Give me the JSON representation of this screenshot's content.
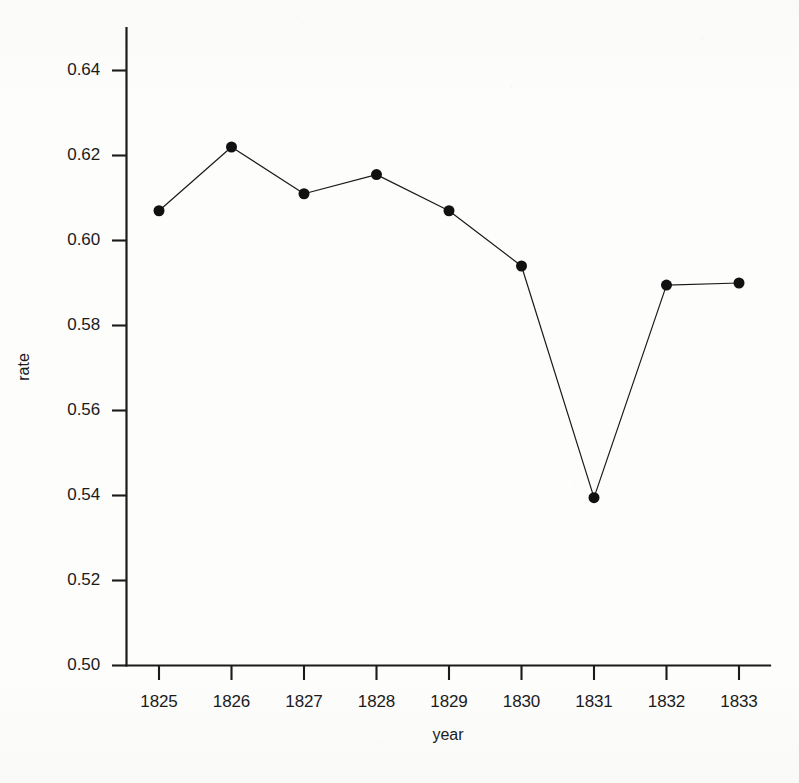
{
  "chart_data": {
    "type": "line",
    "title": "",
    "subtitle": "",
    "xlabel": "year",
    "ylabel": "rate",
    "x": [
      1825,
      1826,
      1827,
      1828,
      1829,
      1830,
      1831,
      1832,
      1833
    ],
    "categories": [
      "1825",
      "1826",
      "1827",
      "1828",
      "1829",
      "1830",
      "1831",
      "1832",
      "1833"
    ],
    "values": [
      0.607,
      0.622,
      0.611,
      0.6155,
      0.607,
      0.594,
      0.5395,
      0.5895,
      0.59
    ],
    "series": [
      {
        "name": "rate",
        "values": [
          0.607,
          0.622,
          0.611,
          0.6155,
          0.607,
          0.594,
          0.5395,
          0.5895,
          0.59
        ]
      }
    ],
    "xlim": [
      1824.6,
      1833.4
    ],
    "ylim": [
      0.5,
      0.6495
    ],
    "xticks": [
      1825,
      1826,
      1827,
      1828,
      1829,
      1830,
      1831,
      1832,
      1833
    ],
    "yticks": [
      0.5,
      0.52,
      0.54,
      0.56,
      0.58,
      0.6,
      0.62,
      0.64
    ],
    "ytick_labels": [
      "0.50",
      "0.52",
      "0.54",
      "0.56",
      "0.58",
      "0.60",
      "0.62",
      "0.64"
    ],
    "xtick_labels": [
      "1825",
      "1826",
      "1827",
      "1828",
      "1829",
      "1830",
      "1831",
      "1832",
      "1833"
    ],
    "grid": false,
    "legend": null,
    "marker": "filled-circle",
    "marker_size": 11,
    "line_width": 1.1,
    "line_color": "#1a1a1a",
    "marker_color": "#111111",
    "axis_color": "#1b1b1b",
    "background_color": "#fdfdfc",
    "annotations": []
  }
}
